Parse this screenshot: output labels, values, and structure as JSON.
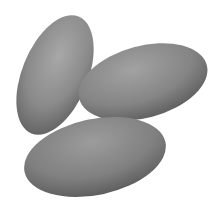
{
  "image": {
    "subject": "three potatoes",
    "background_color": "#ffffff",
    "potato_color": "#8a8a8a",
    "potato_shadow": "#5e5e5e",
    "potato_highlight": "#a8a8a8"
  }
}
